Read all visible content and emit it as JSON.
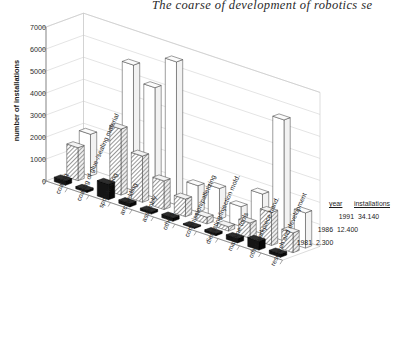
{
  "title": "The coarse of development of robotics  se",
  "chart_data": {
    "type": "bar",
    "title": "The coarse of development of robotics  se",
    "subtitle": "",
    "xlabel": "",
    "ylabel": "number of installations",
    "ylim": [
      0,
      7000
    ],
    "yticks": [
      0,
      1000,
      2000,
      3000,
      4000,
      5000,
      6000,
      7000
    ],
    "ytick_labels": [
      "0",
      "1000",
      "2000",
      "3000",
      "4000",
      "5000",
      "6000",
      "7000"
    ],
    "grid": true,
    "projection": "3d-columns",
    "legend_position": "bottom-right",
    "categories": [
      "coating",
      "coating of glue-/sealing material",
      "spot-welding",
      "arc-welding",
      "assembly",
      "others",
      "commission/palletizing",
      "diecasting/injection mold.",
      "machine tools",
      "other workpiece hand.",
      "research and development"
    ],
    "series": [
      {
        "name": "1981",
        "style": "solid-black",
        "color": "#151515",
        "values": [
          200,
          100,
          700,
          150,
          100,
          150,
          50,
          100,
          200,
          400,
          150
        ]
      },
      {
        "name": "1986",
        "style": "hatched",
        "color": "#9a9a9a",
        "values": [
          1500,
          0,
          3000,
          2100,
          1300,
          800,
          300,
          200,
          700,
          1500,
          900
        ]
      },
      {
        "name": "1991",
        "style": "white",
        "color": "#ffffff",
        "values": [
          1900,
          0,
          5700,
          5000,
          6500,
          1200,
          1400,
          900,
          1800,
          5500,
          1600
        ]
      }
    ],
    "annotations": []
  },
  "legend": {
    "header_year": "year",
    "header_installations": "installations",
    "rows": [
      {
        "year": "1991",
        "installations": "34.140"
      },
      {
        "year": "1986",
        "installations": "12.400"
      },
      {
        "year": "1981",
        "installations": "2.300"
      }
    ]
  },
  "colors": {
    "axis": "#6e6e6e",
    "grid": "#c9c9c9",
    "bar_outline": "#3a3a3a",
    "series_1981": "#151515",
    "series_1986": "#9a9a9a",
    "series_1991": "#ffffff",
    "text": "#1a1a1a",
    "background": "#ffffff"
  }
}
